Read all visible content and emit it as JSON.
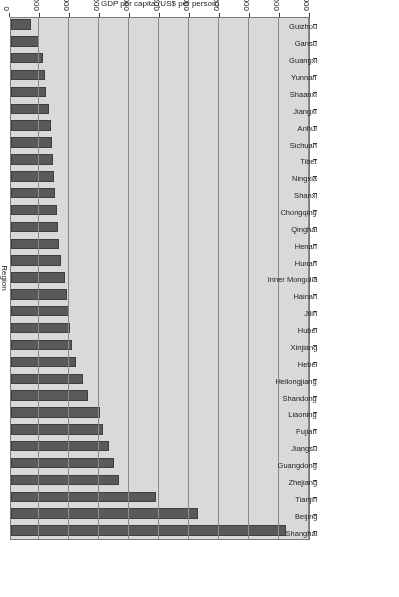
{
  "chart_data": {
    "type": "bar",
    "orientation": "horizontal",
    "title": "",
    "xlabel": "GDP per capita (US$ per person)",
    "ylabel": "Region",
    "xlim": [
      0,
      5000
    ],
    "grid": true,
    "legend": "none",
    "rotated_180": true,
    "tick_labels": [
      "0",
      "500",
      "1,000",
      "1,500",
      "2,000",
      "2,500",
      "3,000",
      "3,500",
      "4,000",
      "4,500",
      "5,000"
    ],
    "tick_values": [
      0,
      500,
      1000,
      1500,
      2000,
      2500,
      3000,
      3500,
      4000,
      4500,
      5000
    ],
    "bar_color": "#595959",
    "plot_background": "#d9d9d9",
    "categories": [
      "Shanghai",
      "Beijing",
      "Tianjin",
      "Zhejiang",
      "Guangdong",
      "Jiangsu",
      "Fujian",
      "Liaoning",
      "Shandong",
      "Heilongjiang",
      "Hebei",
      "Xinjiang",
      "Hubei",
      "Jilin",
      "Hainan",
      "Inner Mongolia",
      "Hunan",
      "Henan",
      "Qinghai",
      "Chongqing",
      "Shanxi",
      "Ningxia",
      "Tibet",
      "Sichuan",
      "Anhui",
      "Jiangxi",
      "Shaanxi",
      "Yunnan",
      "Guangxi",
      "Gansu",
      "Guizhou"
    ],
    "values": [
      4580,
      3120,
      2420,
      1800,
      1720,
      1630,
      1530,
      1490,
      1280,
      1200,
      1090,
      1010,
      980,
      960,
      930,
      900,
      840,
      800,
      780,
      760,
      740,
      720,
      700,
      680,
      660,
      640,
      590,
      560,
      530,
      460,
      340
    ]
  }
}
